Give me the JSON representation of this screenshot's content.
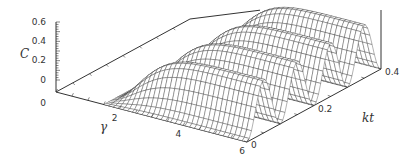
{
  "chart_data": {
    "type": "surface3d",
    "title": "",
    "zlabel": "C",
    "xlabel": "γ",
    "ylabel": "kt",
    "x_range": [
      0,
      6
    ],
    "y_range": [
      0,
      0.4
    ],
    "z_range": [
      0,
      0.6
    ],
    "x_ticks": [
      "0",
      "2",
      "4",
      "6"
    ],
    "y_ticks": [
      "0",
      "0.2",
      "0.4"
    ],
    "z_ticks": [
      "0",
      "0.2",
      "0.4",
      "0.6"
    ],
    "ridges_kt": [
      0.05,
      0.15,
      0.25,
      0.35
    ],
    "max_C": 0.55,
    "grid_on": false,
    "legend": null
  }
}
